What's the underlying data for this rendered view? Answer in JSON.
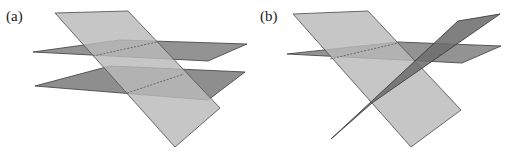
{
  "panels": [
    {
      "label": "(a)",
      "label_pos": [
        6,
        21
      ],
      "description": "Two parallel horizontal planes both cut by one slanted plane",
      "planes": [
        {
          "name": "lower-horizontal-plane",
          "points": "35,86 110,66 245,72 208,100",
          "fill": "#8e8e8e",
          "stroke": "#4a4a4a"
        },
        {
          "name": "upper-horizontal-plane",
          "points": "33,52 120,40 247,44 208,61",
          "fill": "#939393",
          "stroke": "#4a4a4a"
        },
        {
          "name": "slanted-plane",
          "points": "55,13 128,11 220,108 175,147",
          "fill": "#b9b9b9",
          "stroke": "#5a5a5a",
          "opacity": "0.82"
        }
      ],
      "intersection_lines": [
        {
          "name": "upper-intersection-line",
          "x1": 93,
          "y1": 56,
          "x2": 157,
          "y2": 42
        },
        {
          "name": "lower-intersection-line",
          "x1": 127,
          "y1": 93,
          "x2": 184,
          "y2": 74
        }
      ]
    },
    {
      "label": "(b)",
      "label_pos": [
        260,
        21
      ],
      "description": "One horizontal plane and a dark plane both cut by a slanted plane",
      "planes": [
        {
          "name": "horizontal-plane",
          "points": "287,54 398,42 501,46 462,63",
          "fill": "#939393",
          "stroke": "#4a4a4a"
        },
        {
          "name": "slanted-plane",
          "points": "293,14 368,11 461,110 411,147",
          "fill": "#b9b9b9",
          "stroke": "#5a5a5a",
          "opacity": "0.82"
        },
        {
          "name": "dark-plane",
          "points": "458,21 500,14 372,103 331,139",
          "fill": "#6e6e6e",
          "stroke": "#3e3e3e",
          "opacity": "0.88"
        }
      ],
      "intersection_lines": [
        {
          "name": "horizontal-slant-intersection-line",
          "x1": 330,
          "y1": 59,
          "x2": 398,
          "y2": 43
        }
      ]
    }
  ]
}
